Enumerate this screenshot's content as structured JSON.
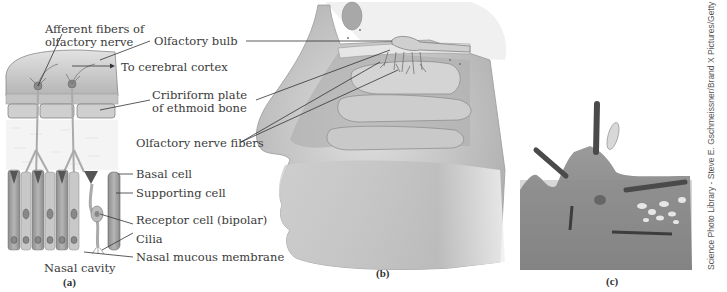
{
  "figure": {
    "panels": [
      {
        "id": "a",
        "label": "(a)"
      },
      {
        "id": "b",
        "label": "(b)"
      },
      {
        "id": "c",
        "label": "(c)"
      }
    ],
    "labels": {
      "afferent_fibers": [
        "Afferent fibers of",
        "olfactory nerve"
      ],
      "olfactory_bulb": "Olfactory bulb",
      "to_cerebral_cortex": "To cerebral cortex",
      "cribriform_plate": [
        "Cribriform plate",
        "of ethmoid bone"
      ],
      "olfactory_nerve_fibers": "Olfactory nerve fibers",
      "basal_cell": "Basal cell",
      "supporting_cell": "Supporting cell",
      "receptor_cell": "Receptor cell (bipolar)",
      "cilia": "Cilia",
      "nasal_mucous_membrane": "Nasal mucous membrane",
      "nasal_cavity": "Nasal cavity"
    },
    "credit": "Science Photo Library - Steve E. Gschmeissner/Brand X Pictures/Getty Images",
    "colors": {
      "background": "#ffffff",
      "tissue_light": "#d8d8d8",
      "tissue_mid": "#a8a8a8",
      "tissue_dark": "#6e6e6e",
      "leader_line": "#333333",
      "micrograph": "#8a8a8a"
    }
  }
}
